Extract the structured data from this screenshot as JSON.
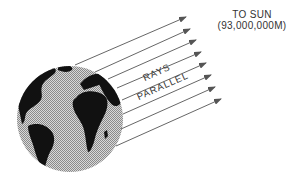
{
  "diagram": {
    "title_line1": "TO SUN",
    "title_line2": "(93,000,000M)",
    "rays_label_line1": "RAYS",
    "rays_label_line2": "PARALLEL",
    "ray_count": 8,
    "colors": {
      "ray": "#555555",
      "globe_ocean": "#b5b5b5",
      "land": "#111111",
      "text": "#333333"
    }
  }
}
